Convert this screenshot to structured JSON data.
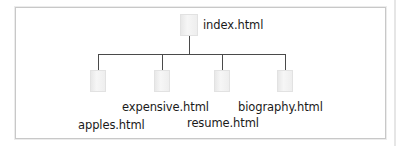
{
  "diagram": {
    "type": "site-map-tree",
    "root": {
      "label": "index.html",
      "icon": "page-icon"
    },
    "children": [
      {
        "label": "apples.html",
        "icon": "page-icon"
      },
      {
        "label": "expensive.html",
        "icon": "page-icon"
      },
      {
        "label": "resume.html",
        "icon": "page-icon"
      },
      {
        "label": "biography.html",
        "icon": "page-icon"
      }
    ],
    "colors": {
      "connector": "#4a4a4a",
      "frame_border": "#c8c8c8",
      "page_icon": "#eeeeee",
      "text": "#1a1a1a"
    }
  }
}
